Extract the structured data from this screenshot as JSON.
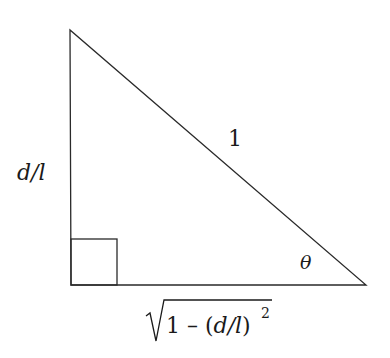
{
  "diagram": {
    "type": "right-triangle",
    "vertices": {
      "top": [
        70,
        30
      ],
      "right_angle": [
        71,
        285
      ],
      "acute": [
        366,
        285
      ]
    },
    "right_angle_marker_size": 46,
    "labels": {
      "vertical_side": "d/l",
      "hypotenuse": "1",
      "angle": "θ",
      "horizontal_side_radicand_1": "1 – (",
      "horizontal_side_radicand_d": "d/l",
      "horizontal_side_radicand_close": ")",
      "horizontal_side_exponent": "2"
    },
    "colors": {
      "stroke": "#2a2a2a",
      "text": "#1a1a1a",
      "background": "#ffffff"
    }
  }
}
